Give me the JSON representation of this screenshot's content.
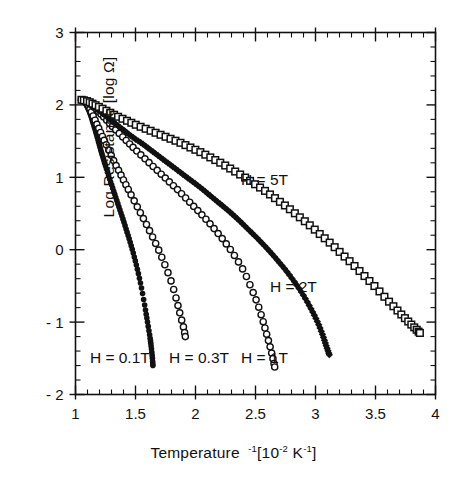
{
  "chart_data": {
    "type": "scatter",
    "title": "",
    "xlabel": "Temperature ⁻¹ [10⁻² K⁻¹]",
    "ylabel": "Log Resistance [log Ω]",
    "xlabel_parts": {
      "base": "Temperature",
      "exp1": "-1",
      "bracket_open": "[10",
      "exp2": "-2",
      "unit": " K",
      "exp3": "-1",
      "bracket_close": "]"
    },
    "ylabel_text": "Log Resistance [log Ω]",
    "xlim": [
      1,
      4
    ],
    "ylim": [
      -2,
      3
    ],
    "xticks": [
      1,
      1.5,
      2,
      2.5,
      3,
      3.5,
      4
    ],
    "xticklabels": [
      "1",
      "1.5",
      "2",
      "2.5",
      "3",
      "3.5",
      "4"
    ],
    "yticks": [
      3,
      2,
      1,
      0,
      -1,
      -2
    ],
    "yticklabels": [
      "3",
      "2",
      "1",
      "0",
      "- 1",
      "- 2"
    ],
    "x_minor_per_major": 5,
    "y_minor_per_major": 5,
    "grid": false,
    "legend_position": "inline-annotations",
    "series": [
      {
        "name": "H = 0.1T",
        "label": "H = 0.1T",
        "marker": "filled-circle",
        "color": "#111111",
        "label_x": 1.12,
        "label_y": -1.5,
        "x": [
          1.05,
          1.07,
          1.09,
          1.11,
          1.13,
          1.15,
          1.17,
          1.19,
          1.21,
          1.23,
          1.25,
          1.28,
          1.31,
          1.34,
          1.37,
          1.4,
          1.43,
          1.46,
          1.49,
          1.52,
          1.55,
          1.58,
          1.6,
          1.62,
          1.63,
          1.64,
          1.645
        ],
        "y": [
          2.07,
          2.05,
          2.0,
          1.93,
          1.84,
          1.73,
          1.62,
          1.5,
          1.38,
          1.27,
          1.16,
          1.0,
          0.85,
          0.7,
          0.55,
          0.4,
          0.24,
          0.08,
          -0.1,
          -0.3,
          -0.53,
          -0.8,
          -1.0,
          -1.2,
          -1.33,
          -1.48,
          -1.6
        ]
      },
      {
        "name": "H = 0.3T",
        "label": "H = 0.3T",
        "marker": "open-circle",
        "color": "#111111",
        "label_x": 1.78,
        "label_y": -1.5,
        "x": [
          1.05,
          1.07,
          1.09,
          1.11,
          1.13,
          1.16,
          1.19,
          1.22,
          1.25,
          1.29,
          1.33,
          1.37,
          1.41,
          1.45,
          1.5,
          1.55,
          1.6,
          1.65,
          1.7,
          1.75,
          1.8,
          1.84,
          1.87,
          1.9,
          1.915
        ],
        "y": [
          2.07,
          2.06,
          2.03,
          1.98,
          1.91,
          1.8,
          1.69,
          1.58,
          1.47,
          1.33,
          1.19,
          1.06,
          0.93,
          0.8,
          0.64,
          0.48,
          0.32,
          0.15,
          -0.03,
          -0.23,
          -0.45,
          -0.68,
          -0.88,
          -1.07,
          -1.2
        ]
      },
      {
        "name": "H = 1T",
        "label": "H = 1T",
        "marker": "open-circle",
        "color": "#111111",
        "label_x": 2.38,
        "label_y": -1.5,
        "x": [
          1.05,
          1.08,
          1.11,
          1.14,
          1.18,
          1.22,
          1.27,
          1.32,
          1.38,
          1.44,
          1.5,
          1.57,
          1.64,
          1.71,
          1.78,
          1.85,
          1.92,
          1.99,
          2.06,
          2.13,
          2.2,
          2.27,
          2.34,
          2.41,
          2.47,
          2.52,
          2.56,
          2.59,
          2.62,
          2.645,
          2.66
        ],
        "y": [
          2.07,
          2.06,
          2.03,
          1.99,
          1.93,
          1.86,
          1.77,
          1.68,
          1.58,
          1.48,
          1.38,
          1.27,
          1.16,
          1.05,
          0.94,
          0.83,
          0.71,
          0.59,
          0.47,
          0.34,
          0.2,
          0.05,
          -0.12,
          -0.32,
          -0.55,
          -0.76,
          -0.97,
          -1.15,
          -1.33,
          -1.5,
          -1.62
        ]
      },
      {
        "name": "H = 2T",
        "label": "H = 2T",
        "marker": "filled-diamond",
        "color": "#111111",
        "label_x": 2.62,
        "label_y": -0.52,
        "x": [
          1.05,
          1.09,
          1.13,
          1.17,
          1.22,
          1.28,
          1.34,
          1.41,
          1.48,
          1.56,
          1.64,
          1.72,
          1.8,
          1.88,
          1.96,
          2.04,
          2.12,
          2.2,
          2.28,
          2.36,
          2.44,
          2.52,
          2.6,
          2.68,
          2.76,
          2.84,
          2.91,
          2.97,
          3.02,
          3.06,
          3.09,
          3.115
        ],
        "y": [
          2.07,
          2.05,
          2.01,
          1.96,
          1.89,
          1.81,
          1.73,
          1.64,
          1.55,
          1.46,
          1.36,
          1.26,
          1.16,
          1.06,
          0.96,
          0.86,
          0.75,
          0.64,
          0.53,
          0.41,
          0.28,
          0.15,
          0.01,
          -0.14,
          -0.3,
          -0.48,
          -0.66,
          -0.84,
          -1.01,
          -1.18,
          -1.33,
          -1.45
        ]
      },
      {
        "name": "H = 5T",
        "label": "H = 5T",
        "marker": "open-square",
        "color": "#111111",
        "label_x": 2.38,
        "label_y": 0.96,
        "x": [
          1.05,
          1.1,
          1.15,
          1.21,
          1.28,
          1.35,
          1.43,
          1.51,
          1.6,
          1.69,
          1.78,
          1.87,
          1.96,
          2.05,
          2.14,
          2.23,
          2.32,
          2.41,
          2.5,
          2.59,
          2.68,
          2.77,
          2.86,
          2.95,
          3.04,
          3.13,
          3.22,
          3.31,
          3.4,
          3.49,
          3.58,
          3.66,
          3.73,
          3.79,
          3.84,
          3.87
        ],
        "y": [
          2.07,
          2.05,
          2.01,
          1.96,
          1.9,
          1.84,
          1.78,
          1.72,
          1.66,
          1.6,
          1.54,
          1.48,
          1.41,
          1.34,
          1.26,
          1.18,
          1.09,
          1.0,
          0.9,
          0.8,
          0.69,
          0.58,
          0.46,
          0.34,
          0.21,
          0.08,
          -0.06,
          -0.2,
          -0.35,
          -0.5,
          -0.66,
          -0.8,
          -0.92,
          -1.02,
          -1.1,
          -1.15
        ]
      }
    ]
  },
  "figure": {
    "background_color": "#ffffff",
    "axis_color": "#111111"
  }
}
